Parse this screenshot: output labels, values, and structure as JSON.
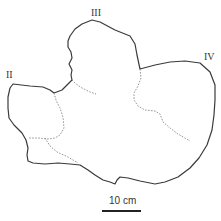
{
  "figure": {
    "outline_color": "#3a3a3a",
    "dashed_color": "#8a8a8a",
    "digit_labels": [
      {
        "id": "II",
        "text": "II"
      },
      {
        "id": "III",
        "text": "III"
      },
      {
        "id": "IV",
        "text": "IV"
      }
    ],
    "scale_bar": {
      "label": "10 cm",
      "color": "#222222"
    }
  }
}
